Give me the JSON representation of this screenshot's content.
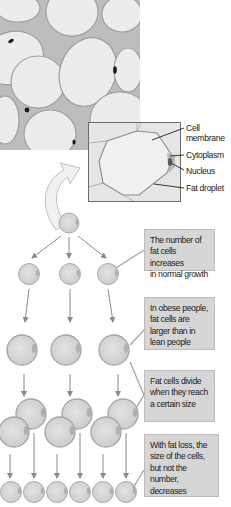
{
  "figure": {
    "micrograph": {
      "description": "Light micrograph of adipose tissue showing large fat cells"
    },
    "inset": {
      "labels": [
        {
          "id": "cell-membrane",
          "text": "Cell\nmembrane"
        },
        {
          "id": "cytoplasm",
          "text": "Cytoplasm"
        },
        {
          "id": "nucleus",
          "text": "Nucleus"
        },
        {
          "id": "fat-droplet",
          "text": "Fat droplet"
        }
      ]
    },
    "notes": [
      {
        "id": "normal-growth",
        "text": "The number of\nfat cells increases\nin normal growth"
      },
      {
        "id": "obese",
        "text": "In obese people,\nfat cells are\nlarger than in\nlean people"
      },
      {
        "id": "divide",
        "text": "Fat cells divide\nwhen they reach\na certain size"
      },
      {
        "id": "fat-loss",
        "text": "With fat loss, the\nsize of the cells,\nbut not the number,\ndecreases"
      }
    ],
    "colors": {
      "cell_fill": "#d9d9d9",
      "cell_stroke": "#9a9a9a",
      "arrow": "#8a8a8a",
      "note_bg": "#d6d6d6",
      "micro_bg": "#c9c9c9"
    }
  }
}
